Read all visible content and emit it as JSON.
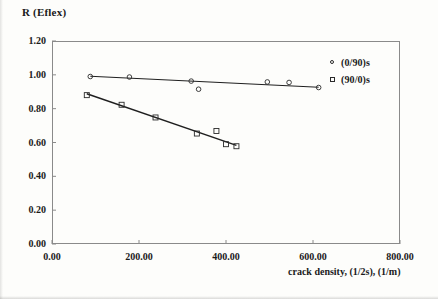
{
  "chart_data": {
    "type": "scatter",
    "title": "",
    "ylabel": "R (Eflex)",
    "xlabel": "crack density, (1/2s), (1/m)",
    "xlim": [
      0,
      800
    ],
    "ylim": [
      0,
      1.2
    ],
    "xticks": [
      "0.00",
      "200.00",
      "400.00",
      "600.00",
      "800.00"
    ],
    "xtick_values": [
      0,
      200,
      400,
      600,
      800
    ],
    "yticks": [
      "0.00",
      "0.20",
      "0.40",
      "0.60",
      "0.80",
      "1.00",
      "1.20"
    ],
    "ytick_values": [
      0,
      0.2,
      0.4,
      0.6,
      0.8,
      1.0,
      1.2
    ],
    "grid": false,
    "legend_position": "upper-right-outside",
    "series": [
      {
        "name": "(0/90)s",
        "marker": "circle",
        "points": [
          {
            "x": 88,
            "y": 0.99
          },
          {
            "x": 178,
            "y": 0.987
          },
          {
            "x": 320,
            "y": 0.963
          },
          {
            "x": 337,
            "y": 0.915
          },
          {
            "x": 495,
            "y": 0.958
          },
          {
            "x": 545,
            "y": 0.955
          },
          {
            "x": 613,
            "y": 0.925
          }
        ],
        "fit_line": {
          "x1": 88,
          "y1": 0.992,
          "x2": 613,
          "y2": 0.927
        }
      },
      {
        "name": "(90/0)s",
        "marker": "square",
        "points": [
          {
            "x": 80,
            "y": 0.88
          },
          {
            "x": 160,
            "y": 0.823
          },
          {
            "x": 238,
            "y": 0.748
          },
          {
            "x": 333,
            "y": 0.653
          },
          {
            "x": 378,
            "y": 0.668
          },
          {
            "x": 400,
            "y": 0.59
          },
          {
            "x": 424,
            "y": 0.578
          }
        ],
        "fit_line": {
          "x1": 80,
          "y1": 0.888,
          "x2": 424,
          "y2": 0.583
        }
      }
    ]
  },
  "colors": {
    "axis": "#8a8a8a",
    "marker_stroke": "#2a2a2a",
    "fit_line": "#1f1f1f",
    "text": "#1a1a1a",
    "background": "#fdfdfb"
  }
}
